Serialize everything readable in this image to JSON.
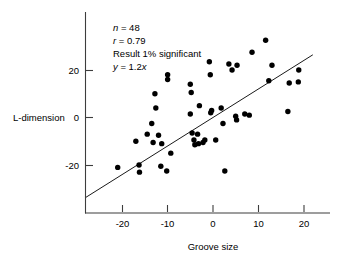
{
  "chart_data": {
    "type": "scatter",
    "title": "",
    "xlabel": "Groove size",
    "ylabel": "L-dimension",
    "xlim": [
      -28,
      23
    ],
    "ylim": [
      -34,
      36
    ],
    "xticks": [
      -20,
      -10,
      0,
      10,
      20
    ],
    "xtick_labels": [
      "-20",
      "-10",
      "0",
      "10",
      "20"
    ],
    "yticks": [
      20,
      0,
      -20
    ],
    "ytick_labels": [
      "20",
      "0",
      "-20"
    ],
    "grid": false,
    "legend": null,
    "annotations": [
      "n = 48",
      "r = 0.79",
      "Result 1% significant",
      "y = 1.2x"
    ],
    "annotation_parts": {
      "n_symbol": "n",
      "n_value": " = 48",
      "r_symbol": "r",
      "r_value": " = 0.79",
      "significance": "Result 1% significant",
      "y_symbol": "y",
      "eq_mid": " = 1.2",
      "x_symbol": "x"
    },
    "fit_line": {
      "equation": "y = 1.2x",
      "slope": 1.2,
      "intercept": 0,
      "x_start": -28,
      "y_start": -33.6,
      "x_end": 22,
      "y_end": 26.4
    },
    "n_points": 48,
    "correlation": 0.79,
    "points": [
      [
        -21.0,
        -21.0
      ],
      [
        -17.0,
        -10.0
      ],
      [
        -16.3,
        -20.0
      ],
      [
        -16.2,
        -23.0
      ],
      [
        -14.5,
        -7.0
      ],
      [
        -13.5,
        -2.5
      ],
      [
        -13.2,
        -10.5
      ],
      [
        -12.8,
        10.0
      ],
      [
        -12.6,
        4.0
      ],
      [
        -12.0,
        -7.5
      ],
      [
        -11.5,
        -20.5
      ],
      [
        -11.3,
        -11.0
      ],
      [
        -10.0,
        18.0
      ],
      [
        -10.0,
        16.0
      ],
      [
        -10.2,
        -22.5
      ],
      [
        -9.3,
        -15.0
      ],
      [
        -5.0,
        14.0
      ],
      [
        -4.8,
        10.5
      ],
      [
        -5.0,
        1.5
      ],
      [
        -4.6,
        -6.5
      ],
      [
        -4.2,
        -9.5
      ],
      [
        -4.0,
        -11.5
      ],
      [
        -3.4,
        -7.0
      ],
      [
        -3.2,
        -11.0
      ],
      [
        -3.0,
        5.0
      ],
      [
        -2.2,
        -10.5
      ],
      [
        -1.8,
        -9.5
      ],
      [
        -0.8,
        23.5
      ],
      [
        -0.6,
        18.0
      ],
      [
        -0.5,
        2.0
      ],
      [
        -0.3,
        3.0
      ],
      [
        0.6,
        -9.5
      ],
      [
        1.8,
        4.0
      ],
      [
        2.2,
        -2.5
      ],
      [
        2.6,
        -22.5
      ],
      [
        3.5,
        22.5
      ],
      [
        4.2,
        20.0
      ],
      [
        5.0,
        0.5
      ],
      [
        5.2,
        -1.0
      ],
      [
        5.3,
        22.0
      ],
      [
        7.0,
        1.5
      ],
      [
        8.0,
        1.0
      ],
      [
        8.6,
        27.5
      ],
      [
        11.6,
        32.5
      ],
      [
        12.3,
        15.5
      ],
      [
        13.0,
        22.0
      ],
      [
        16.5,
        2.5
      ],
      [
        16.8,
        14.5
      ],
      [
        18.8,
        15.0
      ],
      [
        18.9,
        20.0
      ]
    ]
  }
}
